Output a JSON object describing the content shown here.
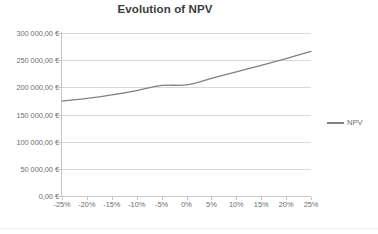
{
  "chart_data": {
    "type": "line",
    "title": "Evolution of NPV",
    "xlabel": "",
    "ylabel": "",
    "categories": [
      "-25%",
      "-20%",
      "-15%",
      "-10%",
      "-5%",
      "0%",
      "5%",
      "10%",
      "15%",
      "20%",
      "25%"
    ],
    "series": [
      {
        "name": "NPV",
        "color": "#808080",
        "values": [
          174500,
          179500,
          186000,
          194000,
          203500,
          204500,
          216500,
          228500,
          240500,
          253000,
          266000
        ]
      }
    ],
    "ylim": [
      0,
      300000
    ],
    "yticks": [
      0,
      50000,
      100000,
      150000,
      200000,
      250000,
      300000
    ],
    "ytick_labels": [
      "0,00 €",
      "50 000,00 €",
      "100 000,00 €",
      "150 000,00 €",
      "200 000,00 €",
      "250 000,00 €",
      "300 000,00 €"
    ],
    "grid": "horizontal",
    "legend_position": "right",
    "legend_entries": [
      "NPV"
    ]
  },
  "legend": {
    "npv_label": "NPV"
  },
  "colors": {
    "series_line": "#808080",
    "gridline": "#d9d9d9",
    "axis": "#c4c4c4",
    "tick_text": "#6e6e6e",
    "title_text": "#3b3b3b",
    "background": "#ffffff"
  }
}
